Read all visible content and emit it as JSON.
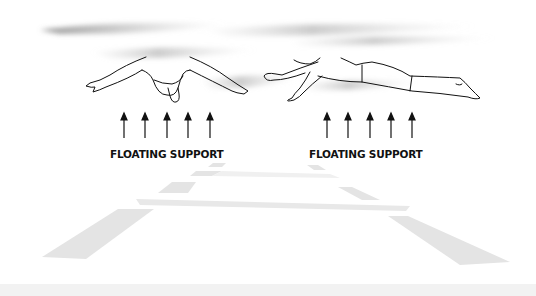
{
  "figure": {
    "panels": [
      {
        "view": "front",
        "arrow_count": 5,
        "label": "FLOATING SUPPORT"
      },
      {
        "view": "side",
        "arrow_count": 5,
        "label": "FLOATING SUPPORT"
      }
    ],
    "colors": {
      "line": "#111111",
      "water_shadow": "#9a9a9a",
      "floor_tile": "#e6e6e6",
      "background": "#ffffff"
    }
  }
}
